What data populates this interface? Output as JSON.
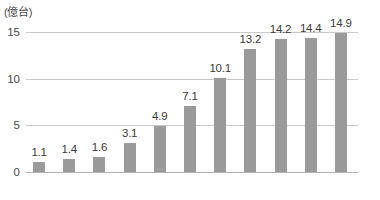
{
  "chart_data": {
    "type": "bar",
    "title": "",
    "subtitle": "",
    "xlabel": "(年)",
    "ylabel": "(億台)",
    "unit_label": "(億台)",
    "axis_unit_label": "(年)",
    "categories": [
      "2007",
      "2008",
      "2009",
      "2010",
      "2011",
      "2012",
      "2013",
      "2014",
      "2015",
      "2016",
      "2017"
    ],
    "values": [
      1.1,
      1.4,
      1.6,
      3.1,
      4.9,
      7.1,
      10.1,
      13.2,
      14.2,
      14.4,
      14.9
    ],
    "value_labels": [
      "1.1",
      "1.4",
      "1.6",
      "3.1",
      "4.9",
      "7.1",
      "10.1",
      "13.2",
      "14.2",
      "14.4",
      "14.9"
    ],
    "xtick_labels": [
      "2007",
      "2009",
      "2011",
      "2013",
      "2015",
      "2017"
    ],
    "xtick_categories": [
      "2007",
      "2009",
      "2011",
      "2013",
      "2015",
      "2017"
    ],
    "ytick_labels": [
      "0",
      "5",
      "10",
      "15"
    ],
    "ytick_values": [
      0,
      5,
      10,
      15
    ],
    "ylim": [
      0,
      15
    ],
    "grid": true,
    "legend": false,
    "legend_position": "none",
    "bar_color": "#9a9a9a",
    "gridline_color": "#c9c9c9",
    "axis_color": "#b3b3b3",
    "text_color": "#3a3a3a",
    "background_color": "#ffffff"
  }
}
